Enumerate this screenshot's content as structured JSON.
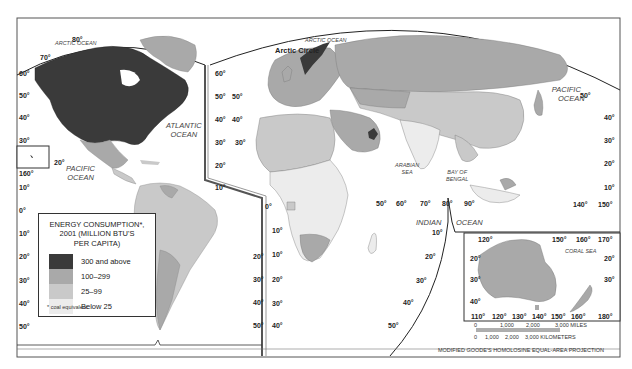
{
  "map": {
    "title": "Energy Consumption, 2001 (Million BTU's per capita)",
    "projection": "MODIFIED GOODE'S HOMOLOSINE EQUAL-AREA PROJECTION"
  },
  "legend": {
    "title_line1": "ENERGY CONSUMPTION*,",
    "title_line2": "2001 (MILLION BTU'S",
    "title_line3": "PER CAPITA)",
    "items": [
      {
        "label": "300 and above",
        "color": "#3a3a3a"
      },
      {
        "label": "100–299",
        "color": "#a9a9a9"
      },
      {
        "label": "25–99",
        "color": "#c9c9c9"
      },
      {
        "label": "Below 25",
        "color": "#ececec"
      }
    ],
    "note": "* coal equivalent"
  },
  "oceans": {
    "arctic_left": "ARCTIC OCEAN",
    "arctic_right": "ARCTIC OCEAN",
    "arctic_circle": "Arctic Circle",
    "atlantic_1": "ATLANTIC",
    "atlantic_2": "OCEAN",
    "pacific_left_1": "PACIFIC",
    "pacific_left_2": "OCEAN",
    "pacific_right_1": "PACIFIC",
    "pacific_right_2": "OCEAN",
    "indian_1": "INDIAN",
    "indian_2": "OCEAN",
    "arabian_1": "ARABIAN",
    "arabian_2": "SEA",
    "bengal_1": "BAY OF",
    "bengal_2": "BENGAL",
    "coral": "CORAL SEA"
  },
  "graticule": {
    "left_lat": [
      "60°",
      "50°",
      "40°",
      "30°",
      "10°",
      "0°",
      "10°",
      "20°",
      "30°",
      "40°",
      "50°"
    ],
    "na_top": [
      "70°",
      "80°"
    ],
    "na_right": [
      "60°",
      "50°",
      "40°",
      "30°",
      "20°",
      "10°"
    ],
    "afr_left": [
      "50°",
      "40°",
      "30°",
      "10°",
      "0°",
      "10°",
      "20°",
      "30°",
      "40°",
      "50°"
    ],
    "sa_right": [
      "20°",
      "30°",
      "40°",
      "50°"
    ],
    "hawaii": [
      "20°",
      "160°"
    ],
    "indian_lon": [
      "50°",
      "60°",
      "70°",
      "80°",
      "90°"
    ],
    "indian_lat": [
      "10°",
      "20°",
      "30°",
      "40°",
      "50°"
    ],
    "pacific_right_lat": [
      "50°",
      "40°",
      "30°",
      "20°",
      "10°"
    ],
    "asia_lon": [
      "140°",
      "150°"
    ],
    "aus_top": [
      "120°",
      "150°",
      "160°",
      "170°"
    ],
    "aus_bottom": [
      "110°",
      "120°",
      "130°",
      "140°",
      "150°",
      "160°",
      "180°"
    ],
    "aus_left": [
      "20°",
      "30°",
      "40°"
    ],
    "aus_right": [
      "20°",
      "30°"
    ]
  },
  "scale": {
    "miles_ticks": [
      "0",
      "1,000",
      "2,000",
      "3,000 MILES"
    ],
    "km_ticks": [
      "0",
      "1,000",
      "2,000",
      "3,000 KILOMETERS"
    ]
  },
  "colors": {
    "high": "#3a3a3a",
    "mid_high": "#a9a9a9",
    "mid_low": "#c9c9c9",
    "low": "#ececec",
    "water": "#ffffff",
    "border": "#333333"
  }
}
